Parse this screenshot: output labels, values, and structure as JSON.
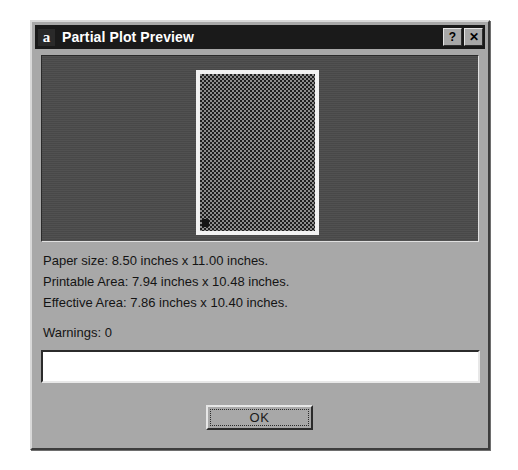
{
  "window": {
    "icon_glyph": "a",
    "icon_name": "app-icon",
    "title": "Partial Plot Preview",
    "help_button_label": "?",
    "close_button_label": "✕"
  },
  "preview": {
    "panel_name": "plot-preview-panel",
    "page_thumbnail_name": "page-thumbnail"
  },
  "info": {
    "lines": [
      "Paper size:  8.50 inches x 11.00 inches.",
      "Printable Area:  7.94 inches x 10.48 inches.",
      "Effective Area:  7.86 inches x 10.40 inches."
    ],
    "paper_size_label": "Paper size:",
    "paper_size_value": "8.50 inches x 11.00 inches.",
    "printable_area_label": "Printable Area:",
    "printable_area_value": "7.94 inches x 10.48 inches.",
    "effective_area_label": "Effective Area:",
    "effective_area_value": "7.86 inches x 10.40 inches."
  },
  "warnings": {
    "label": "Warnings:  0",
    "count": "0",
    "field_value": "",
    "field_placeholder": ""
  },
  "buttons": {
    "ok_label": "OK"
  },
  "colors": {
    "dialog_face": "#a8a8a8",
    "titlebar": "#1a1a1a",
    "titlebar_text": "#ffffff",
    "preview_background": "#4b4b4b",
    "page_border": "#f2f2f2",
    "field_background": "#ffffff",
    "text": "#141414"
  }
}
